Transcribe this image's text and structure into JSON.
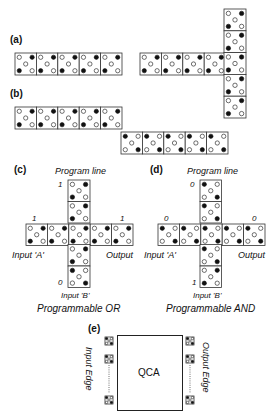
{
  "panels": {
    "a": {
      "label": "(a)"
    },
    "b": {
      "label": "(b)"
    },
    "c": {
      "label": "(c)",
      "program_line": "Program line",
      "program_value": "1",
      "input_a": "Input 'A'",
      "input_a_value": "1",
      "input_b": "Input 'B'",
      "input_b_value": "0",
      "output": "Output",
      "output_value": "1",
      "caption": "Programmable OR"
    },
    "d": {
      "label": "(d)",
      "program_line": "Program line",
      "program_value": "0",
      "input_a": "Input 'A'",
      "input_a_value": "0",
      "input_b": "Input 'B'",
      "input_b_value": "1",
      "output": "Output",
      "output_value": "0",
      "caption": "Programmable AND"
    },
    "e": {
      "label": "(e)",
      "center": "QCA",
      "left_edge": "Input Edge",
      "right_edge": "Output Edge"
    }
  },
  "colors": {
    "stroke": "#333333",
    "dot_filled": "#111111",
    "dot_empty": "#ffffff"
  }
}
